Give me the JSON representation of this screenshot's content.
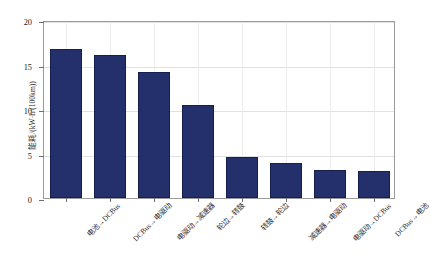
{
  "chart_data": {
    "type": "bar",
    "title": "",
    "xlabel": "",
    "ylabel": "能耗/(kW·h/(100km))",
    "ylim": [
      0,
      20
    ],
    "yticks": [
      0,
      5,
      10,
      15,
      20
    ],
    "ytick_labels": [
      "0",
      "5",
      "10",
      "15",
      "20"
    ],
    "grid": true,
    "legend": "none",
    "bar_color": "#23306B",
    "bar_edge_color": "#151F4D",
    "categories": [
      "电池→DCBus",
      "DCBus→电驱动",
      "电驱动→减速器",
      "轮边→转鼓",
      "转鼓→轮边",
      "减速器→电驱动",
      "电驱动→DCBus",
      "DCBus→电池"
    ],
    "values": [
      16.7,
      16.1,
      14.2,
      10.4,
      4.6,
      3.9,
      3.2,
      3.0
    ]
  }
}
